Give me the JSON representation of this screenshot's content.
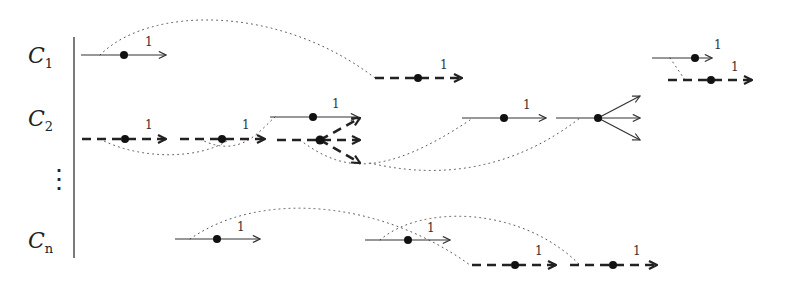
{
  "diagram": {
    "rows": [
      {
        "id": "c1",
        "label": "C",
        "subscript": "1",
        "y": 55
      },
      {
        "id": "c2",
        "label": "C",
        "subscript": "2",
        "y": 118
      },
      {
        "id": "vdots",
        "label": "⋮",
        "y": 178
      },
      {
        "id": "cn",
        "label": "C",
        "subscript": "n",
        "y": 240
      }
    ],
    "arrows": [
      {
        "style": "solid",
        "x1": 81,
        "x2": 166,
        "y": 55,
        "dot": 124,
        "weight": "1",
        "wx": 145,
        "wy": 46
      },
      {
        "style": "dashed",
        "x1": 375,
        "x2": 462,
        "y": 78,
        "dot": 418,
        "weight": "1",
        "wx": 440,
        "wy": 69
      },
      {
        "style": "solid",
        "x1": 652,
        "x2": 712,
        "y": 58,
        "dot": 695,
        "weight": "1",
        "wx": 717,
        "wy": 49
      },
      {
        "style": "dashed",
        "x1": 668,
        "x2": 752,
        "y": 80,
        "dot": 711,
        "weight": "1",
        "wx": 734,
        "wy": 71
      },
      {
        "style": "dashed",
        "x1": 82,
        "x2": 166,
        "y": 139,
        "dot": 125,
        "weight": "1",
        "wx": 147,
        "wy": 129
      },
      {
        "style": "dashed",
        "x1": 180,
        "x2": 265,
        "y": 139,
        "dot": 222,
        "weight": "1",
        "wx": 244,
        "wy": 129
      },
      {
        "style": "solid",
        "x1": 270,
        "x2": 360,
        "y": 117,
        "dot": 313,
        "weight": "1",
        "wx": 334,
        "wy": 108
      },
      {
        "style": "solid",
        "x1": 462,
        "x2": 546,
        "y": 118,
        "dot": 504,
        "weight": "1",
        "wx": 525,
        "wy": 109
      },
      {
        "style": "solid",
        "x1": 175,
        "x2": 260,
        "y": 239,
        "dot": 217,
        "weight": "1",
        "wx": 240,
        "wy": 231
      },
      {
        "style": "solid",
        "x1": 365,
        "x2": 450,
        "y": 240,
        "dot": 408,
        "weight": "1",
        "wx": 430,
        "wy": 232
      },
      {
        "style": "dashed",
        "x1": 472,
        "x2": 556,
        "y": 265,
        "dot": 515,
        "weight": "1",
        "wx": 537,
        "wy": 255
      },
      {
        "style": "dashed",
        "x1": 570,
        "x2": 657,
        "y": 265,
        "dot": 613,
        "weight": "1",
        "wx": 635,
        "wy": 255
      }
    ],
    "branches": [
      {
        "style": "dashed",
        "x1": 277,
        "y": 140,
        "dot": 320,
        "targets": [
          [
            360,
            118
          ],
          [
            360,
            140
          ],
          [
            360,
            163
          ]
        ]
      },
      {
        "style": "solid",
        "x1": 556,
        "y": 118,
        "dot": 598,
        "targets": [
          [
            640,
            96
          ],
          [
            640,
            118
          ],
          [
            640,
            140
          ]
        ]
      }
    ],
    "weight_labels": [
      "1",
      "1",
      "1",
      "1",
      "1",
      "1",
      "1",
      "1",
      "1",
      "1",
      "1",
      "1"
    ]
  }
}
